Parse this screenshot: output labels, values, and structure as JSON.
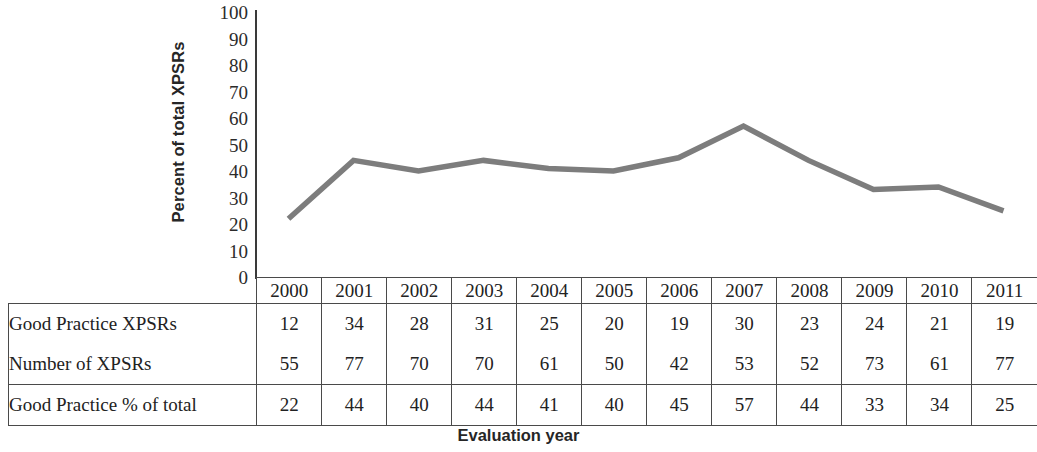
{
  "chart_data": {
    "type": "line",
    "title": "",
    "xlabel": "Evaluation year",
    "ylabel": "Percent of total XPSRs",
    "categories": [
      "2000",
      "2001",
      "2002",
      "2003",
      "2004",
      "2005",
      "2006",
      "2007",
      "2008",
      "2009",
      "2010",
      "2011"
    ],
    "ylim": [
      0,
      100
    ],
    "y_ticks": [
      100,
      90,
      80,
      70,
      60,
      50,
      40,
      30,
      20,
      10,
      0
    ],
    "grid": false,
    "legend": "none",
    "line_color": "#7d7d7d",
    "series": [
      {
        "name": "Good Practice % of total",
        "values": [
          22,
          44,
          40,
          44,
          41,
          40,
          45,
          57,
          44,
          33,
          34,
          25
        ]
      }
    ],
    "table_series": [
      {
        "name": "Good Practice XPSRs",
        "values": [
          12,
          34,
          28,
          31,
          25,
          20,
          19,
          30,
          23,
          24,
          21,
          19
        ]
      },
      {
        "name": "Number of XPSRs",
        "values": [
          55,
          77,
          70,
          70,
          61,
          50,
          42,
          53,
          52,
          73,
          61,
          77
        ]
      },
      {
        "name": "Good Practice % of total",
        "values": [
          22,
          44,
          40,
          44,
          41,
          40,
          45,
          57,
          44,
          33,
          34,
          25
        ]
      }
    ]
  },
  "axis": {
    "y_title": "Percent of total XPSRs",
    "x_title": "Evaluation year",
    "y_tick_labels": [
      "100",
      "90",
      "80",
      "70",
      "60",
      "50",
      "40",
      "30",
      "20",
      "10",
      "0"
    ]
  },
  "table": {
    "year_headers": [
      "2000",
      "2001",
      "2002",
      "2003",
      "2004",
      "2005",
      "2006",
      "2007",
      "2008",
      "2009",
      "2010",
      "2011"
    ],
    "rows": [
      {
        "label": "Good Practice XPSRs",
        "cells": [
          "12",
          "34",
          "28",
          "31",
          "25",
          "20",
          "19",
          "30",
          "23",
          "24",
          "21",
          "19"
        ]
      },
      {
        "label": "Number of XPSRs",
        "cells": [
          "55",
          "77",
          "70",
          "70",
          "61",
          "50",
          "42",
          "53",
          "52",
          "73",
          "61",
          "77"
        ]
      },
      {
        "label": "Good Practice % of total",
        "cells": [
          "22",
          "44",
          "40",
          "44",
          "41",
          "40",
          "45",
          "57",
          "44",
          "33",
          "34",
          "25"
        ]
      }
    ]
  }
}
